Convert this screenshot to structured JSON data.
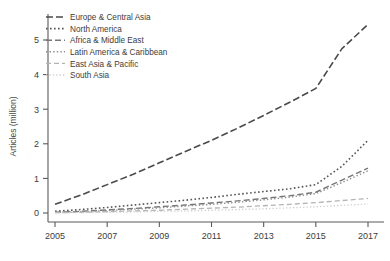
{
  "chart_data": {
    "type": "line",
    "title": "",
    "xlabel": "",
    "ylabel": "Articles (million)",
    "xlim": [
      2005,
      2017
    ],
    "ylim": [
      0,
      5.6
    ],
    "grid": false,
    "legend_position": "top-left",
    "xticks": [
      2005,
      2007,
      2009,
      2011,
      2013,
      2015,
      2017
    ],
    "xtick_labels": [
      "2005",
      "2007",
      "2009",
      "2011",
      "2013",
      "2015",
      "2017"
    ],
    "yticks": [
      0,
      1,
      2,
      3,
      4,
      5
    ],
    "ytick_labels": [
      "0",
      "1",
      "2",
      "3",
      "4",
      "5"
    ],
    "x": [
      2005,
      2006,
      2007,
      2008,
      2009,
      2010,
      2011,
      2012,
      2013,
      2014,
      2015,
      2016,
      2017
    ],
    "series": [
      {
        "name": "Europe & Central Asia",
        "color": "#4a4a4a",
        "dash": "7,3",
        "width": 1.6,
        "values": [
          0.25,
          0.52,
          0.82,
          1.12,
          1.45,
          1.78,
          2.1,
          2.45,
          2.82,
          3.2,
          3.6,
          4.75,
          5.45
        ]
      },
      {
        "name": "North America",
        "color": "#555555",
        "dash": "1.6,2.4",
        "width": 1.6,
        "values": [
          0.05,
          0.1,
          0.16,
          0.23,
          0.3,
          0.37,
          0.45,
          0.54,
          0.62,
          0.7,
          0.82,
          1.35,
          2.1
        ]
      },
      {
        "name": "Africa & Middle East",
        "color": "#767676",
        "dash": "6,3",
        "width": 1.4,
        "values": [
          0.02,
          0.05,
          0.09,
          0.13,
          0.18,
          0.23,
          0.29,
          0.35,
          0.42,
          0.5,
          0.6,
          0.95,
          1.3
        ]
      },
      {
        "name": "Latin America & Caribbean",
        "color": "#8d8d8d",
        "dash": "1.4,2.2",
        "width": 1.4,
        "values": [
          0.02,
          0.04,
          0.07,
          0.11,
          0.15,
          0.2,
          0.25,
          0.31,
          0.38,
          0.46,
          0.56,
          0.88,
          1.22
        ]
      },
      {
        "name": "East Asia & Pacific",
        "color": "#b4b4b4",
        "dash": "5,3",
        "width": 1.3,
        "values": [
          0.01,
          0.02,
          0.04,
          0.06,
          0.08,
          0.11,
          0.14,
          0.17,
          0.21,
          0.25,
          0.3,
          0.36,
          0.42
        ]
      },
      {
        "name": "South Asia",
        "color": "#cdcdcd",
        "dash": "1.3,2.1",
        "width": 1.3,
        "values": [
          0.005,
          0.01,
          0.02,
          0.03,
          0.05,
          0.06,
          0.08,
          0.1,
          0.12,
          0.15,
          0.18,
          0.22,
          0.26
        ]
      }
    ]
  },
  "axes": {
    "ylabel": "Articles (million)",
    "ytick_labels": [
      "0",
      "1",
      "2",
      "3",
      "4",
      "5"
    ],
    "xtick_labels": [
      "2005",
      "2007",
      "2009",
      "2011",
      "2013",
      "2015",
      "2017"
    ]
  },
  "legend": {
    "entries": [
      "Europe & Central Asia",
      "North America",
      "Africa & Middle East",
      "Latin America & Caribbean",
      "East Asia & Pacific",
      "South Asia"
    ]
  }
}
